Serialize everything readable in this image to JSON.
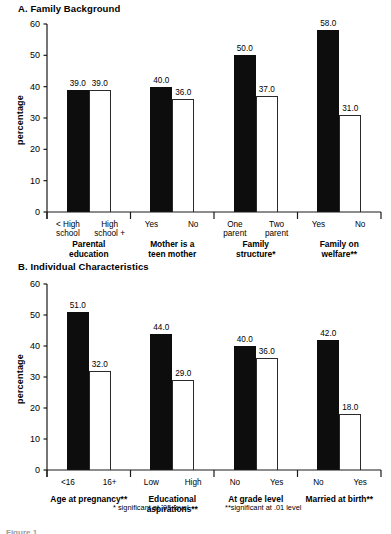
{
  "figure": {
    "ylabel": "percentage",
    "footnotes": [
      {
        "text": "* significant at .05 level"
      },
      {
        "text": "**significant at .01 level"
      }
    ],
    "tail_text": "Figure 1"
  },
  "chart_data": [
    {
      "type": "bar",
      "title": "A. Family Background",
      "xlabel": "",
      "ylabel": "percentage",
      "ylim": [
        0,
        60
      ],
      "yticks": [
        0,
        10,
        20,
        30,
        40,
        50,
        60
      ],
      "grid": false,
      "legend": "none",
      "groups": [
        {
          "group_label": "Parental education",
          "group_label_lines": [
            "Parental",
            "education"
          ],
          "bars": [
            {
              "category": "< High school",
              "category_lines": [
                "< High",
                "school"
              ],
              "value": 39.0,
              "label": "39.0",
              "fill": "solid"
            },
            {
              "category": "High school +",
              "category_lines": [
                "High",
                "school +"
              ],
              "value": 39.0,
              "label": "39.0",
              "fill": "open"
            }
          ]
        },
        {
          "group_label": "Mother is a teen mother",
          "group_label_lines": [
            "Mother is a",
            "teen mother"
          ],
          "bars": [
            {
              "category": "Yes",
              "category_lines": [
                "Yes"
              ],
              "value": 40.0,
              "label": "40.0",
              "fill": "solid"
            },
            {
              "category": "No",
              "category_lines": [
                "No"
              ],
              "value": 36.0,
              "label": "36.0",
              "fill": "open"
            }
          ]
        },
        {
          "group_label": "Family structure*",
          "group_label_lines": [
            "Family",
            "structure*"
          ],
          "bars": [
            {
              "category": "One parent",
              "category_lines": [
                "One",
                "parent"
              ],
              "value": 50.0,
              "label": "50.0",
              "fill": "solid"
            },
            {
              "category": "Two parent",
              "category_lines": [
                "Two",
                "parent"
              ],
              "value": 37.0,
              "label": "37.0",
              "fill": "open"
            }
          ]
        },
        {
          "group_label": "Family on welfare**",
          "group_label_lines": [
            "Family on",
            "welfare**"
          ],
          "bars": [
            {
              "category": "Yes",
              "category_lines": [
                "Yes"
              ],
              "value": 58.0,
              "label": "58.0",
              "fill": "solid"
            },
            {
              "category": "No",
              "category_lines": [
                "No"
              ],
              "value": 31.0,
              "label": "31.0",
              "fill": "open"
            }
          ]
        }
      ]
    },
    {
      "type": "bar",
      "title": "B. Individual Characteristics",
      "xlabel": "",
      "ylabel": "percentage",
      "ylim": [
        0,
        60
      ],
      "yticks": [
        0,
        10,
        20,
        30,
        40,
        50,
        60
      ],
      "grid": false,
      "legend": "none",
      "groups": [
        {
          "group_label": "Age at pregnancy**",
          "group_label_lines": [
            "Age at pregnancy**"
          ],
          "bars": [
            {
              "category": "<16",
              "category_lines": [
                "<16"
              ],
              "value": 51.0,
              "label": "51.0",
              "fill": "solid"
            },
            {
              "category": "16+",
              "category_lines": [
                "16+"
              ],
              "value": 32.0,
              "label": "32.0",
              "fill": "open"
            }
          ]
        },
        {
          "group_label": "Educational aspirations**",
          "group_label_lines": [
            "Educational",
            "aspirations**"
          ],
          "bars": [
            {
              "category": "Low",
              "category_lines": [
                "Low"
              ],
              "value": 44.0,
              "label": "44.0",
              "fill": "solid"
            },
            {
              "category": "High",
              "category_lines": [
                "High"
              ],
              "value": 29.0,
              "label": "29.0",
              "fill": "open"
            }
          ]
        },
        {
          "group_label": "At grade level",
          "group_label_lines": [
            "At grade level"
          ],
          "bars": [
            {
              "category": "No",
              "category_lines": [
                "No"
              ],
              "value": 40.0,
              "label": "40.0",
              "fill": "solid"
            },
            {
              "category": "Yes",
              "category_lines": [
                "Yes"
              ],
              "value": 36.0,
              "label": "36.0",
              "fill": "open"
            }
          ]
        },
        {
          "group_label": "Married at birth**",
          "group_label_lines": [
            "Married at birth**"
          ],
          "bars": [
            {
              "category": "No",
              "category_lines": [
                "No"
              ],
              "value": 42.0,
              "label": "42.0",
              "fill": "solid"
            },
            {
              "category": "Yes",
              "category_lines": [
                "Yes"
              ],
              "value": 18.0,
              "label": "18.0",
              "fill": "open"
            }
          ]
        }
      ]
    }
  ]
}
